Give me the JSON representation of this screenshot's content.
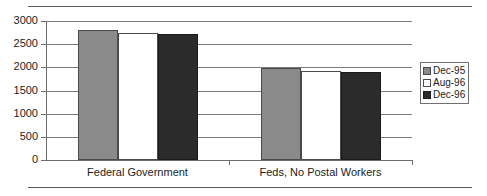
{
  "chart_data": {
    "type": "bar",
    "title": "",
    "subtitle": "",
    "xlabel": "",
    "ylabel": "",
    "categories": [
      "Federal Government",
      "Feds, No Postal Workers"
    ],
    "series": [
      {
        "name": "Dec-95",
        "color": "#8a8a8a",
        "values": [
          2810,
          1975
        ]
      },
      {
        "name": "Aug-96",
        "color": "#ffffff",
        "values": [
          2750,
          1920
        ]
      },
      {
        "name": "Dec-96",
        "color": "#2b2b2b",
        "values": [
          2720,
          1890
        ]
      }
    ],
    "ylim": [
      0,
      3000
    ],
    "y_ticks": [
      0,
      500,
      1000,
      1500,
      2000,
      2500,
      3000
    ],
    "y_tick_labels": [
      "0",
      "500",
      "1000",
      "1500",
      "2000",
      "2500",
      "3000"
    ],
    "grid": true,
    "grid_axis": "y",
    "legend": {
      "position": "right",
      "entries": [
        "Dec-95",
        "Aug-96",
        "Dec-96"
      ]
    }
  },
  "axis": {
    "y_labels": [
      "3000",
      "2500",
      "2000",
      "1500",
      "1000",
      "500",
      "0"
    ],
    "x_labels": [
      "Federal Government",
      "Feds, No Postal Workers"
    ]
  },
  "legend": {
    "items": [
      {
        "label": "Dec-95"
      },
      {
        "label": "Aug-96"
      },
      {
        "label": "Dec-96"
      }
    ]
  }
}
